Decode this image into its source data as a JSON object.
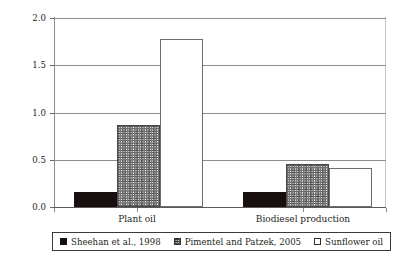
{
  "chart_data": {
    "type": "bar",
    "title": "",
    "subtitle": "",
    "xlabel": "",
    "ylabel": "Fossil energy input (MJ/MJ biodiesel)",
    "categories": [
      "Plant oil",
      "Biodiesel production"
    ],
    "series": [
      {
        "name": "Sheehan et al., 1998",
        "fill": "solid",
        "values": [
          0.155,
          0.155
        ]
      },
      {
        "name": "Pimentel and Patzek, 2005",
        "fill": "hatch",
        "values": [
          0.87,
          0.46
        ]
      },
      {
        "name": "Sunflower oil",
        "fill": "open",
        "values": [
          1.78,
          0.41
        ]
      }
    ],
    "ylim": [
      0.0,
      2.0
    ],
    "yticks": [
      0.0,
      0.5,
      1.0,
      1.5,
      2.0
    ],
    "ytick_labels": [
      "0.0",
      "0.5",
      "1.0",
      "1.5",
      "2.0"
    ],
    "grid": "horizontal",
    "legend_position": "bottom",
    "annotations": []
  },
  "legend": {
    "entries": [
      {
        "label": "Sheehan et al., 1998",
        "swatch": "solid"
      },
      {
        "label": "Pimentel and Patzek, 2005",
        "swatch": "hatch"
      },
      {
        "label": "Sunflower oil",
        "swatch": "open"
      }
    ]
  },
  "colors": {
    "series_solid": "#17100f",
    "series_hatch": "#4d4d4d",
    "series_open": "#ffffff",
    "axis": "#5a5a5a",
    "gridline": "#8c8c8c",
    "text": "#231f20"
  }
}
